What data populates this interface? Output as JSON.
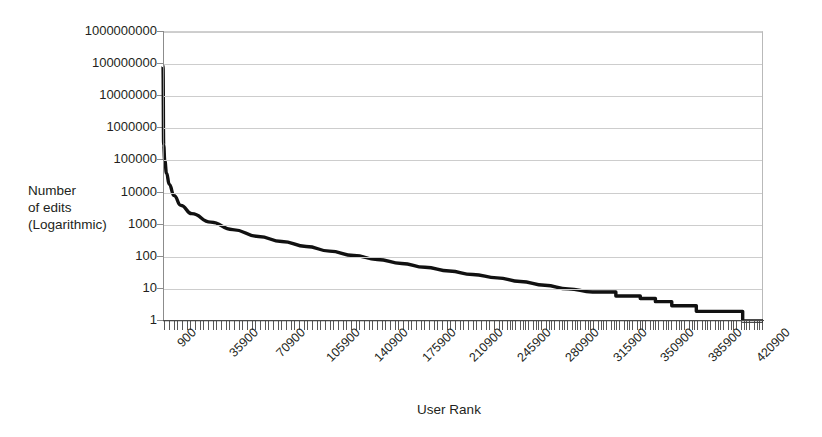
{
  "chart_data": {
    "type": "line",
    "title": "",
    "xlabel": "User Rank",
    "ylabel": "Number of edits (Logarithmic)",
    "ylabel_lines": [
      "Number",
      "of edits",
      "(Logarithmic)"
    ],
    "yscale": "log",
    "ylim": [
      1,
      1000000000
    ],
    "ytick_labels": [
      "1000000000",
      "100000000",
      "10000000",
      "1000000",
      "100000",
      "10000",
      "1000",
      "100",
      "10",
      "1"
    ],
    "ytick_values": [
      1000000000,
      100000000,
      10000000,
      1000000,
      100000,
      10000,
      1000,
      100,
      10,
      1
    ],
    "xlim": [
      900,
      440900
    ],
    "xtick_labels": [
      "900",
      "35900",
      "70900",
      "105900",
      "140900",
      "175900",
      "210900",
      "245900",
      "280900",
      "315900",
      "350900",
      "385900",
      "420900"
    ],
    "xtick_values": [
      900,
      35900,
      70900,
      105900,
      140900,
      175900,
      210900,
      245900,
      280900,
      315900,
      350900,
      385900,
      420900
    ],
    "grid": "horizontal",
    "legend": "none",
    "series": [
      {
        "name": "Number of edits",
        "color": "#111111",
        "x": [
          900,
          1400,
          2200,
          3500,
          5500,
          9000,
          14000,
          22000,
          35900,
          52000,
          70900,
          88000,
          105900,
          123000,
          140900,
          158000,
          175900,
          193000,
          210900,
          228000,
          245900,
          263000,
          280900,
          298000,
          315900,
          333000,
          350900,
          362000,
          368000,
          374000,
          380000,
          385900,
          392000,
          398000,
          404000,
          410000,
          416000,
          420900,
          426000,
          432000,
          436000,
          440900
        ],
        "y": [
          90000000,
          300000,
          100000,
          40000,
          18000,
          8000,
          4000,
          2200,
          1200,
          700,
          430,
          300,
          210,
          150,
          110,
          82,
          62,
          47,
          36,
          28,
          22,
          17,
          13,
          10,
          8,
          6,
          5,
          4,
          4,
          3,
          3,
          3,
          2,
          2,
          2,
          2,
          2,
          2,
          1,
          1,
          1,
          1
        ]
      }
    ]
  },
  "colors": {
    "curve": "#111111",
    "gridline": "#cdcdcd",
    "axis": "#8c8c8c",
    "text": "#231f20",
    "background": "#ffffff"
  }
}
